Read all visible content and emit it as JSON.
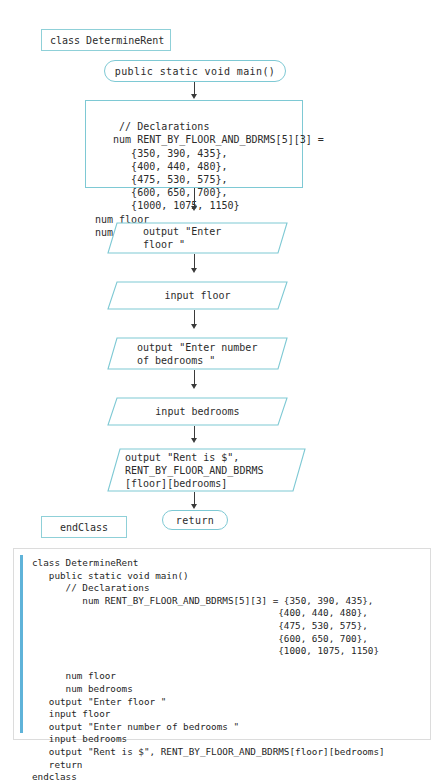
{
  "diagram": {
    "class_header": "class DetermineRent",
    "main_terminal": "public static void main()",
    "declarations": "// Declarations\n   num RENT_BY_FLOOR_AND_BDRMS[5][3] =\n      {350, 390, 435},\n      {400, 440, 480},\n      {475, 530, 575},\n      {600, 650, 700},\n      {1000, 1075, 1150}\nnum floor\nnum bedrooms",
    "io_output_floor": "output \"Enter\nfloor \"",
    "io_input_floor": "input floor",
    "io_output_bedrooms": "output \"Enter number\nof bedrooms \"",
    "io_input_bedrooms": "input bedrooms",
    "io_output_rent": "output \"Rent is $\",\nRENT_BY_FLOOR_AND_BDRMS\n[floor][bedrooms]",
    "return_terminal": "return",
    "end_class": "endClass"
  },
  "code_listing": {
    "text": "class DetermineRent\n   public static void main()\n      // Declarations\n         num RENT_BY_FLOOR_AND_BDRMS[5][3] = {350, 390, 435},\n                                            {400, 440, 480},\n                                            {475, 530, 575},\n                                            {600, 650, 700},\n                                            {1000, 1075, 1150}\n\n      num floor\n      num bedrooms\n   output \"Enter floor \"\n   input floor\n   output \"Enter number of bedrooms \"\n   input bedrooms\n   output \"Rent is $\", RENT_BY_FLOOR_AND_BDRMS[floor][bedrooms]\n   return\nendclass"
  },
  "colors": {
    "flowchart_stroke": "#7ec9d4",
    "arrow": "#3a3a3a",
    "code_accent_bar": "#5fb3d9",
    "code_panel_border": "#dcdcdc",
    "text": "#2b2b2b"
  }
}
